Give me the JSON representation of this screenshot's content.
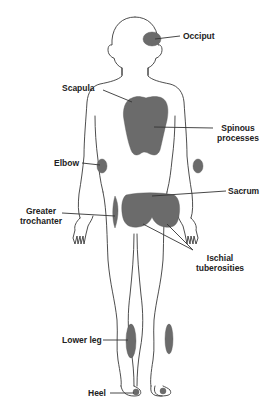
{
  "colors": {
    "outline": "#3a3a3a",
    "pressure_area": "#6b6b6b",
    "background": "#ffffff",
    "label_text": "#222222"
  },
  "labels": {
    "occiput": "Occiput",
    "scapula": "Scapula",
    "spinous_line1": "Spinous",
    "spinous_line2": "processes",
    "elbow": "Elbow",
    "sacrum": "Sacrum",
    "greater_line1": "Greater",
    "greater_line2": "trochanter",
    "ischial_line1": "Ischial",
    "ischial_line2": "tuberosities",
    "lower_leg": "Lower leg",
    "heel": "Heel"
  }
}
